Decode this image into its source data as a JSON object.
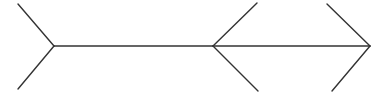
{
  "diagram": {
    "type": "muller-lyer-illusion",
    "stroke_color": "#333333",
    "stroke_width": 1.4,
    "background": "#ffffff",
    "segments": [
      {
        "name": "left-segment",
        "line": {
          "x1": 54,
          "y1": 46,
          "x2": 213,
          "y2": 46
        },
        "left_fins": "tail-open",
        "right_fins": "arrowhead-inward"
      },
      {
        "name": "right-segment",
        "line": {
          "x1": 213,
          "y1": 46,
          "x2": 370,
          "y2": 46
        },
        "left_fins": "arrowhead-inward",
        "right_fins": "arrowhead"
      }
    ],
    "fins": [
      {
        "name": "left-fin-top",
        "x1": 54,
        "y1": 46,
        "x2": 18,
        "y2": 4
      },
      {
        "name": "left-fin-bottom",
        "x1": 54,
        "y1": 46,
        "x2": 18,
        "y2": 89
      },
      {
        "name": "middle-fin-top",
        "x1": 213,
        "y1": 46,
        "x2": 257,
        "y2": 3
      },
      {
        "name": "middle-fin-bottom",
        "x1": 213,
        "y1": 46,
        "x2": 258,
        "y2": 91
      },
      {
        "name": "right-fin-top",
        "x1": 370,
        "y1": 46,
        "x2": 327,
        "y2": 4
      },
      {
        "name": "right-fin-bottom",
        "x1": 370,
        "y1": 46,
        "x2": 332,
        "y2": 91
      }
    ]
  }
}
